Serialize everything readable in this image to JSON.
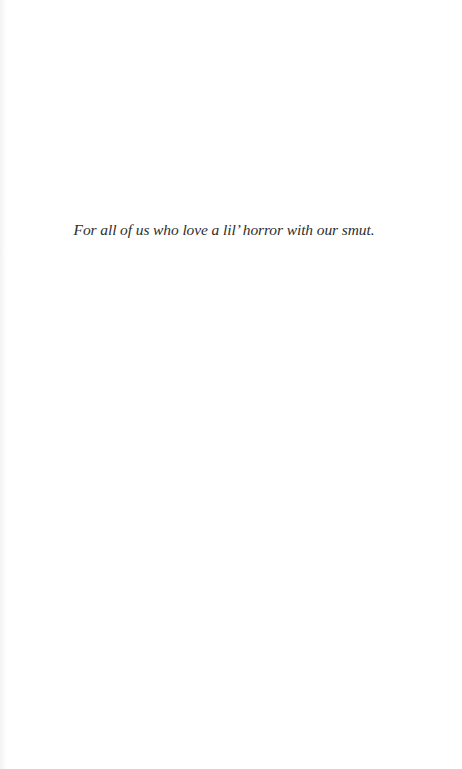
{
  "page": {
    "dedication": "For all of us who love a lil’ horror with our smut."
  }
}
